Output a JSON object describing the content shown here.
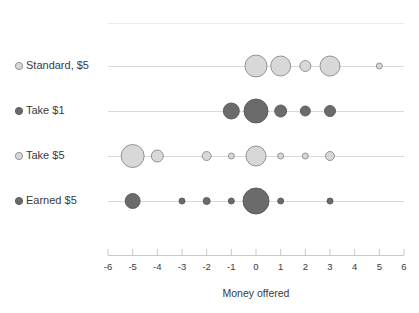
{
  "chart_data": {
    "type": "scatter",
    "title": "",
    "xlabel": "Money offered",
    "ylabel": "",
    "xlim": [
      -6,
      6
    ],
    "xticks": [
      -6,
      -5,
      -4,
      -3,
      -2,
      -1,
      0,
      1,
      2,
      3,
      4,
      5,
      6
    ],
    "xtick_labels": [
      "-6",
      "-5",
      "-4",
      "-3",
      "-2",
      "-1",
      "0",
      "1",
      "2",
      "3",
      "4",
      "5",
      "6"
    ],
    "grid": false,
    "legend": "row-labels-left",
    "note": "Bubble/dot plot; marker area encodes frequency of each offer amount per condition",
    "categories": [
      "Standard, $5",
      "Take $1",
      "Take $5",
      "Earned $5"
    ],
    "series": [
      {
        "name": "Standard, $5",
        "marker_style": "light",
        "fill": "#d8d8d8",
        "stroke": "#8a8a8a",
        "points": [
          {
            "x": 0,
            "size": 11.0
          },
          {
            "x": 1,
            "size": 10.0
          },
          {
            "x": 2,
            "size": 5.5
          },
          {
            "x": 3,
            "size": 10.0
          },
          {
            "x": 5,
            "size": 3.0
          }
        ]
      },
      {
        "name": "Take $1",
        "marker_style": "dark",
        "fill": "#6b6b6b",
        "stroke": "#575757",
        "points": [
          {
            "x": -1,
            "size": 8.0
          },
          {
            "x": 0,
            "size": 12.0
          },
          {
            "x": 1,
            "size": 6.0
          },
          {
            "x": 2,
            "size": 5.0
          },
          {
            "x": 3,
            "size": 5.5
          }
        ]
      },
      {
        "name": "Take $5",
        "marker_style": "light",
        "fill": "#d8d8d8",
        "stroke": "#8a8a8a",
        "points": [
          {
            "x": -5,
            "size": 11.5
          },
          {
            "x": -4,
            "size": 6.0
          },
          {
            "x": -2,
            "size": 4.5
          },
          {
            "x": -1,
            "size": 3.0
          },
          {
            "x": 0,
            "size": 10.0
          },
          {
            "x": 1,
            "size": 3.0
          },
          {
            "x": 2,
            "size": 3.0
          },
          {
            "x": 3,
            "size": 4.5
          }
        ]
      },
      {
        "name": "Earned $5",
        "marker_style": "dark",
        "fill": "#6b6b6b",
        "stroke": "#575757",
        "points": [
          {
            "x": -5,
            "size": 7.5
          },
          {
            "x": -3,
            "size": 3.0
          },
          {
            "x": -2,
            "size": 3.5
          },
          {
            "x": -1,
            "size": 3.0
          },
          {
            "x": 0,
            "size": 13.0
          },
          {
            "x": 1,
            "size": 3.0
          },
          {
            "x": 3,
            "size": 3.0
          }
        ]
      }
    ]
  },
  "colors": {
    "light_fill": "#d8d8d8",
    "light_stroke": "#8a8a8a",
    "dark_fill": "#6b6b6b",
    "dark_stroke": "#575757",
    "rowline": "#c9c9c9",
    "axis": "#bdbdbd",
    "text": "#3a3a3a"
  }
}
